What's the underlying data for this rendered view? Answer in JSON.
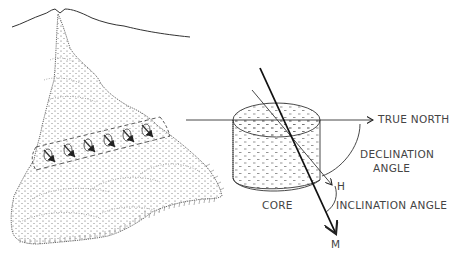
{
  "figure": {
    "panels": [
      {
        "id": "volcano",
        "description": "Volcano with lava flow; oriented core samples drilled along a line across the flow, each with magnetization arrow"
      },
      {
        "id": "core",
        "description": "Cylindrical core sample with true north reference, magnetic vector M and horizontal projection H"
      }
    ],
    "labels": {
      "true_north": "TRUE NORTH",
      "declination_line1": "DECLINATION",
      "declination_line2": "ANGLE",
      "h": "H",
      "core": "CORE",
      "inclination": "INCLINATION ANGLE",
      "m": "M"
    },
    "sample_count": 6,
    "colors": {
      "line": "#222222",
      "stipple": "#555555",
      "text": "#444444"
    }
  }
}
